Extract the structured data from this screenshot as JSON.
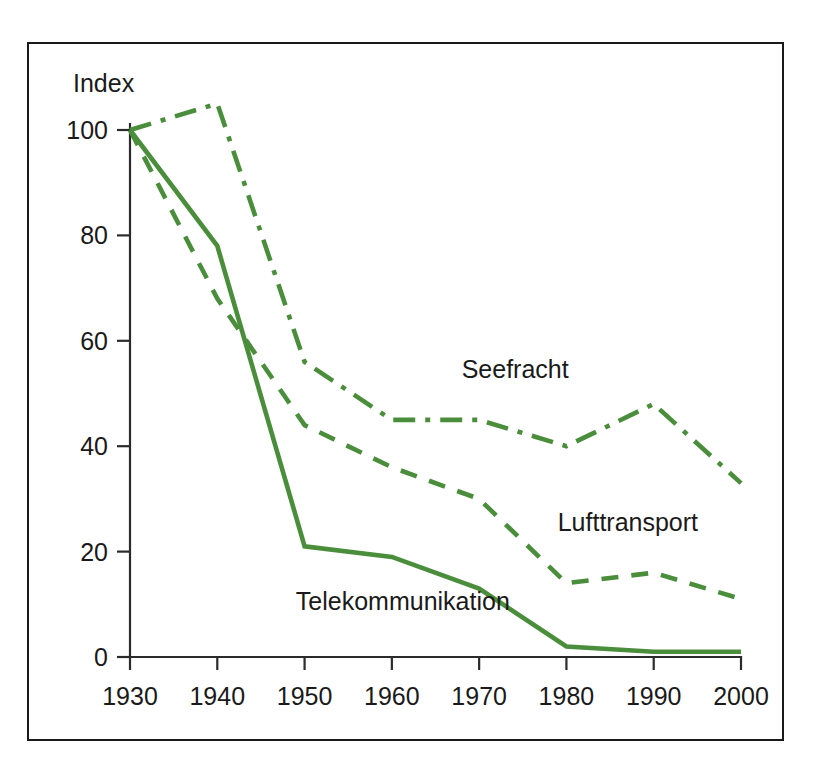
{
  "chart_data": {
    "type": "line",
    "title": "",
    "subtitle": "",
    "xlabel": "",
    "ylabel": "Index",
    "ylabel_position": "top-left-inside",
    "x": [
      1930,
      1940,
      1950,
      1960,
      1970,
      1980,
      1990,
      2000
    ],
    "categories": [
      "1930",
      "1940",
      "1950",
      "1960",
      "1970",
      "1980",
      "1990",
      "2000"
    ],
    "xlim": [
      1930,
      2000
    ],
    "ylim": [
      0,
      110
    ],
    "yticks": [
      0,
      20,
      40,
      60,
      80,
      100
    ],
    "ytick_labels": [
      "0",
      "20",
      "40",
      "60",
      "80",
      "100"
    ],
    "xticks": [
      1930,
      1940,
      1950,
      1960,
      1970,
      1980,
      1990,
      2000
    ],
    "xtick_labels": [
      "1930",
      "1940",
      "1950",
      "1960",
      "1970",
      "1980",
      "1990",
      "2000"
    ],
    "grid": false,
    "legend": "inline-annotations",
    "legend_position": "inline",
    "series": [
      {
        "name": "Seefracht",
        "style": "dash-dot",
        "color": "#4A8E3C",
        "values": [
          100,
          105,
          56,
          45,
          45,
          40,
          48,
          33
        ],
        "label_x": 1968,
        "label_y": 53
      },
      {
        "name": "Lufttransport",
        "style": "dashed",
        "color": "#4A8E3C",
        "values": [
          100,
          68,
          44,
          36,
          30,
          14,
          16,
          11
        ],
        "label_x": 1979,
        "label_y": 24
      },
      {
        "name": "Telekommunikation",
        "style": "solid",
        "color": "#4A8E3C",
        "values": [
          100,
          78,
          21,
          19,
          13,
          2,
          1,
          1
        ],
        "label_x": 1949,
        "label_y": 9
      }
    ]
  },
  "axes": {
    "y_axis_title": "Index",
    "y_tick_labels": [
      "100",
      "80",
      "60",
      "40",
      "20",
      "0"
    ],
    "x_tick_labels": [
      "1930",
      "1940",
      "1950",
      "1960",
      "1970",
      "1980",
      "1990",
      "2000"
    ]
  },
  "annotations": {
    "seefracht": "Seefracht",
    "lufttransport": "Lufttransport",
    "telekommunikation": "Telekommunikation"
  },
  "colors": {
    "series_green": "#4A8E3C",
    "axis_black": "#2b2b2b",
    "frame_black": "#1a1a1a",
    "background": "#ffffff"
  }
}
